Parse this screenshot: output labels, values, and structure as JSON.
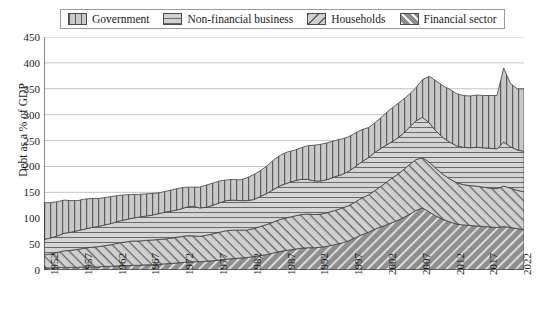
{
  "chart_data": {
    "type": "area",
    "stacked": true,
    "title": "",
    "xlabel": "",
    "ylabel": "Debt as a % of GDP",
    "ylim": [
      0,
      450
    ],
    "ytick_step": 50,
    "yticks": [
      0,
      50,
      100,
      150,
      200,
      250,
      300,
      350,
      400,
      450
    ],
    "xlim": [
      1952,
      2023
    ],
    "xticks": [
      1952,
      1957,
      1962,
      1967,
      1972,
      1977,
      1982,
      1987,
      1992,
      1997,
      2002,
      2007,
      2012,
      2017,
      2022
    ],
    "grid": true,
    "grid_axis": "y",
    "legend_position": "top",
    "stack_order_bottom_to_top": [
      "Financial sector",
      "Households",
      "Non-financial business",
      "Government"
    ],
    "x": [
      1952,
      1953,
      1954,
      1955,
      1956,
      1957,
      1958,
      1959,
      1960,
      1961,
      1962,
      1963,
      1964,
      1965,
      1966,
      1967,
      1968,
      1969,
      1970,
      1971,
      1972,
      1973,
      1974,
      1975,
      1976,
      1977,
      1978,
      1979,
      1980,
      1981,
      1982,
      1983,
      1984,
      1985,
      1986,
      1987,
      1988,
      1989,
      1990,
      1991,
      1992,
      1993,
      1994,
      1995,
      1996,
      1997,
      1998,
      1999,
      2000,
      2001,
      2002,
      2003,
      2004,
      2005,
      2006,
      2007,
      2008,
      2009,
      2010,
      2011,
      2012,
      2013,
      2014,
      2015,
      2016,
      2017,
      2018,
      2019,
      2020,
      2021,
      2022,
      2023
    ],
    "series": [
      {
        "name": "Financial sector",
        "pattern": "diagonal-forward",
        "color": "#8e8e8e",
        "values": [
          4,
          4,
          5,
          5,
          5,
          5,
          6,
          6,
          6,
          7,
          7,
          8,
          8,
          9,
          9,
          10,
          10,
          11,
          12,
          13,
          14,
          15,
          16,
          16,
          17,
          18,
          19,
          21,
          22,
          23,
          24,
          26,
          28,
          30,
          33,
          36,
          38,
          40,
          42,
          43,
          43,
          44,
          46,
          49,
          52,
          56,
          62,
          68,
          73,
          79,
          84,
          89,
          94,
          100,
          107,
          115,
          120,
          112,
          104,
          98,
          93,
          89,
          87,
          86,
          85,
          84,
          83,
          82,
          84,
          82,
          80,
          78
        ]
      },
      {
        "name": "Households",
        "pattern": "diagonal-back",
        "color": "#cfcfcf",
        "values": [
          25,
          27,
          29,
          32,
          33,
          35,
          36,
          38,
          39,
          40,
          42,
          44,
          46,
          47,
          47,
          47,
          48,
          48,
          48,
          49,
          50,
          51,
          50,
          49,
          50,
          52,
          54,
          55,
          55,
          54,
          53,
          54,
          56,
          58,
          60,
          62,
          63,
          64,
          65,
          65,
          64,
          64,
          65,
          66,
          67,
          68,
          69,
          71,
          72,
          75,
          79,
          84,
          88,
          92,
          96,
          98,
          97,
          96,
          92,
          87,
          83,
          80,
          78,
          77,
          77,
          76,
          75,
          75,
          78,
          76,
          74,
          73
        ]
      },
      {
        "name": "Non-financial business",
        "pattern": "horizontal",
        "color": "#d2d2d2",
        "values": [
          30,
          31,
          32,
          34,
          35,
          36,
          37,
          38,
          39,
          40,
          41,
          42,
          43,
          44,
          46,
          47,
          48,
          50,
          52,
          52,
          53,
          55,
          57,
          55,
          54,
          55,
          57,
          58,
          58,
          57,
          57,
          56,
          58,
          60,
          63,
          65,
          67,
          68,
          68,
          67,
          65,
          64,
          64,
          65,
          65,
          66,
          68,
          70,
          72,
          74,
          73,
          71,
          70,
          70,
          72,
          75,
          78,
          76,
          72,
          71,
          71,
          71,
          72,
          73,
          75,
          76,
          77,
          77,
          85,
          80,
          78,
          78
        ]
      },
      {
        "name": "Government",
        "pattern": "vertical",
        "color": "#c9c9c9",
        "values": [
          71,
          68,
          66,
          64,
          61,
          58,
          58,
          56,
          54,
          53,
          52,
          50,
          48,
          46,
          44,
          43,
          42,
          40,
          40,
          41,
          41,
          39,
          37,
          40,
          43,
          43,
          42,
          40,
          40,
          40,
          44,
          48,
          50,
          53,
          57,
          59,
          60,
          59,
          61,
          65,
          69,
          71,
          71,
          70,
          69,
          67,
          65,
          62,
          58,
          57,
          60,
          64,
          66,
          66,
          64,
          64,
          73,
          90,
          97,
          100,
          102,
          101,
          100,
          100,
          101,
          101,
          102,
          103,
          143,
          122,
          118,
          121
        ]
      }
    ],
    "totals_notes": {
      "1952": 130,
      "2009": 365,
      "2020": 390,
      "2023": 350
    }
  },
  "legend": {
    "items": [
      {
        "label": "Government",
        "swatch": "fill-gov"
      },
      {
        "label": "Non-financial business",
        "swatch": "fill-biz"
      },
      {
        "label": "Households",
        "swatch": "fill-hh"
      },
      {
        "label": "Financial sector",
        "swatch": "fill-fin"
      }
    ]
  }
}
